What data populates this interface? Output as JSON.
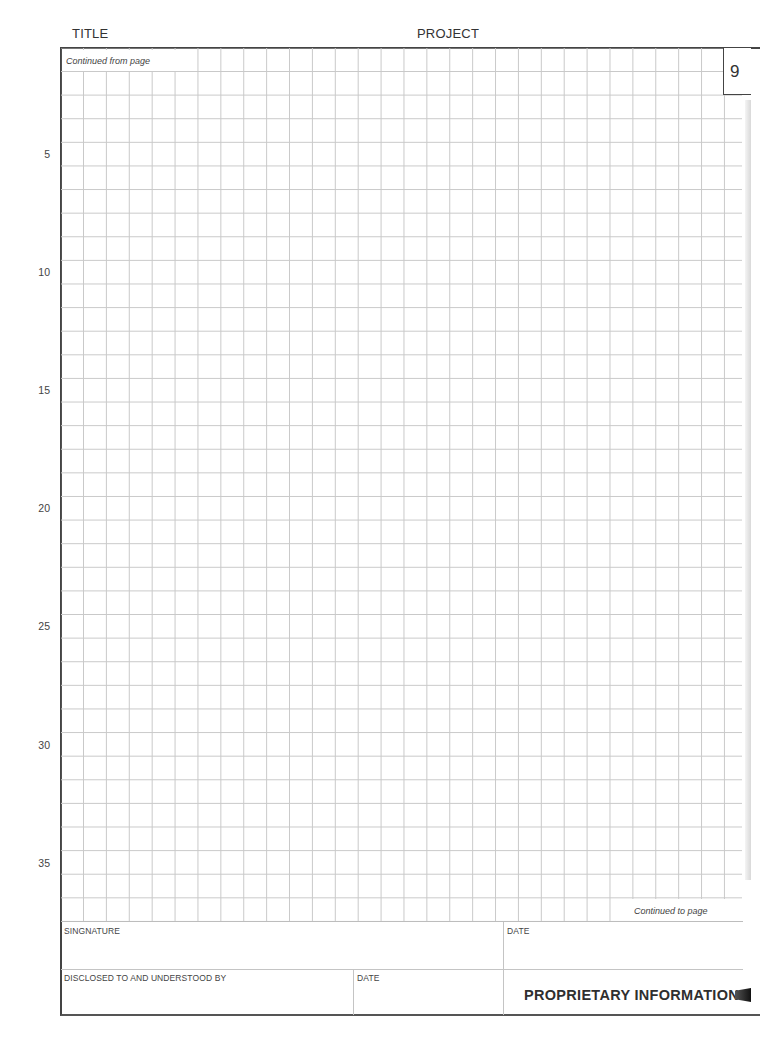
{
  "header": {
    "title_label": "TITLE",
    "project_label": "PROJECT"
  },
  "page": {
    "number": "9",
    "continued_from_label": "Continued from page",
    "continued_to_label": "Continued to page"
  },
  "row_labels": [
    {
      "text": "5",
      "y": 155
    },
    {
      "text": "10",
      "y": 273
    },
    {
      "text": "15",
      "y": 391
    },
    {
      "text": "20",
      "y": 509
    },
    {
      "text": "25",
      "y": 627
    },
    {
      "text": "30",
      "y": 746
    },
    {
      "text": "35",
      "y": 864
    }
  ],
  "footer": {
    "signature_label": "SINGNATURE",
    "signature_date_label": "DATE",
    "disclosed_label": "DISCLOSED TO AND UNDERSTOOD BY",
    "disclosed_date_label": "DATE",
    "proprietary_label": "PROPRIETARY INFORMATION"
  }
}
